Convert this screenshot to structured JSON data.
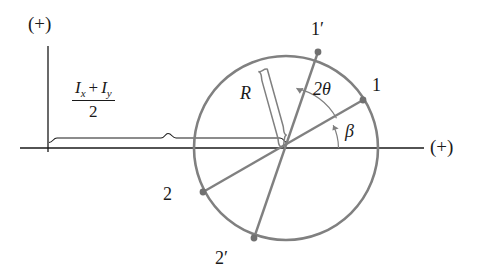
{
  "figure": {
    "width": 481,
    "height": 275,
    "background": "#ffffff",
    "line_color": "#808080",
    "axis_color": "#1a1a1a",
    "text_color": "#1a1a1a"
  },
  "axes": {
    "vertical": {
      "label": "(+)",
      "x": 48,
      "y_top": 46,
      "y_bottom": 152
    },
    "horizontal": {
      "label": "(+)",
      "y": 148,
      "x_left": 20,
      "x_right": 424
    }
  },
  "dimension": {
    "numerator_left": "I",
    "numerator_left_sub": "x",
    "operator": "+",
    "numerator_right": "I",
    "numerator_right_sub": "y",
    "denominator": "2",
    "description": "average moment of inertia, distance from origin to circle center"
  },
  "circle": {
    "center_x": 286,
    "center_y": 148,
    "radius": 92,
    "radius_label": "R"
  },
  "points": [
    {
      "name": "point-1-prime",
      "label": "1′",
      "x": 318,
      "y": 52,
      "label_x": 311,
      "label_y": 20
    },
    {
      "name": "point-1",
      "label": "1",
      "x": 363,
      "y": 100,
      "label_x": 372,
      "label_y": 76
    },
    {
      "name": "point-2",
      "label": "2",
      "x": 203,
      "y": 192,
      "label_x": 163,
      "label_y": 185
    },
    {
      "name": "point-2-prime",
      "label": "2′",
      "x": 254,
      "y": 238,
      "label_x": 215,
      "label_y": 249
    }
  ],
  "angles": [
    {
      "name": "angle-two-theta",
      "label": "2θ",
      "label_x": 313,
      "label_y": 80,
      "description": "angle from line 1-2 to line 1'-2'"
    },
    {
      "name": "angle-beta",
      "label": "β",
      "label_x": 345,
      "label_y": 122,
      "description": "angle from horizontal axis to line 1-2"
    }
  ]
}
